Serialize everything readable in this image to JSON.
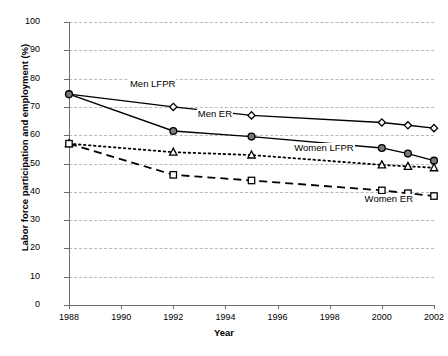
{
  "chart_data": {
    "type": "line",
    "title": "",
    "xlabel": "Year",
    "ylabel": "Labor force participation and employment (%)",
    "xlim": [
      1988,
      2002
    ],
    "ylim": [
      0,
      100
    ],
    "ytick_step": 10,
    "xtick_step": 2,
    "grid": true,
    "legend_position": "inline-annotations",
    "xticks": [
      "1988",
      "1990",
      "1992",
      "1994",
      "1996",
      "1998",
      "2000",
      "2002"
    ],
    "yticks": [
      "0",
      "10",
      "20",
      "30",
      "40",
      "50",
      "60",
      "70",
      "80",
      "90",
      "100"
    ],
    "x": [
      1988,
      1992,
      1995,
      2000,
      2001,
      2002
    ],
    "series": [
      {
        "name": "Men LFPR",
        "label": "Men LFPR",
        "marker": "open-diamond",
        "line_style": "solid",
        "color": "#000000",
        "values": [
          74.5,
          70.0,
          67.0,
          64.5,
          63.5,
          62.5
        ]
      },
      {
        "name": "Men ER",
        "label": "Men ER",
        "marker": "filled-circle",
        "line_style": "solid",
        "color": "#000000",
        "values": [
          74.5,
          61.5,
          59.5,
          55.5,
          53.5,
          51.0
        ]
      },
      {
        "name": "Women LFPR",
        "label": "Women LFPR",
        "marker": "open-triangle",
        "line_style": "dotted",
        "color": "#000000",
        "values": [
          57.0,
          54.0,
          53.0,
          49.5,
          49.0,
          48.5
        ]
      },
      {
        "name": "Women ER",
        "label": "Women ER",
        "marker": "open-square",
        "line_style": "dashed",
        "color": "#000000",
        "values": [
          57.0,
          46.0,
          44.0,
          40.5,
          39.5,
          38.5
        ]
      }
    ],
    "annotations": [
      {
        "text": "Men LFPR",
        "x": 1990.3,
        "y": 78.0
      },
      {
        "text": "Men ER",
        "x": 1992.9,
        "y": 67.5
      },
      {
        "text": "Women LFPR",
        "x": 1996.6,
        "y": 55.5
      },
      {
        "text": "Women ER",
        "x": 1999.3,
        "y": 37.5
      }
    ]
  },
  "style": {
    "axis_color": "#6d6d6d",
    "grid_color": "#b9b9b9",
    "background": "#ffffff",
    "ink": "#000000"
  }
}
